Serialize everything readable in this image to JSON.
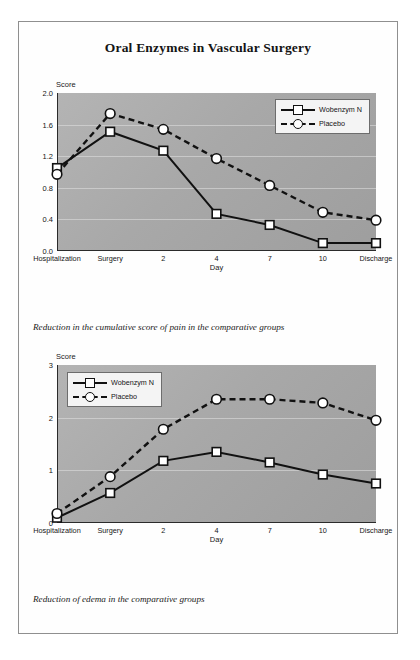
{
  "document": {
    "title": "Oral Enzymes in Vascular Surgery"
  },
  "figures": [
    {
      "id": "figure-1",
      "caption": "Reduction in the cumulative score of pain in the comparative groups",
      "legend_position": "top-right",
      "chart_data": {
        "type": "line",
        "title": "",
        "xlabel": "Day",
        "ylabel": "Score",
        "categories": [
          "Hospitalization",
          "Surgery",
          "2",
          "4",
          "7",
          "10",
          "Discharge"
        ],
        "yticks": [
          "0.0",
          "0.4",
          "0.8",
          "1.2",
          "1.6",
          "2.0"
        ],
        "ylim": [
          0.0,
          2.0
        ],
        "grid": true,
        "legend": [
          "Wobenzym N",
          "Placebo"
        ],
        "series": [
          {
            "name": "Wobenzym N",
            "marker": "square",
            "linestyle": "solid",
            "values": [
              1.05,
              1.51,
              1.27,
              0.47,
              0.33,
              0.1,
              0.1
            ]
          },
          {
            "name": "Placebo",
            "marker": "circle",
            "linestyle": "dashed",
            "values": [
              0.97,
              1.74,
              1.54,
              1.17,
              0.83,
              0.49,
              0.39
            ]
          }
        ]
      }
    },
    {
      "id": "figure-2",
      "caption": "Reduction of edema in the comparative groups",
      "legend_position": "top-left",
      "chart_data": {
        "type": "line",
        "title": "",
        "xlabel": "Day",
        "ylabel": "Score",
        "categories": [
          "Hospitalization",
          "Surgery",
          "2",
          "4",
          "7",
          "10",
          "Discharge"
        ],
        "yticks": [
          "0",
          "1",
          "2",
          "3"
        ],
        "ylim": [
          0,
          3
        ],
        "grid": true,
        "legend": [
          "Wobenzym N",
          "Placebo"
        ],
        "series": [
          {
            "name": "Wobenzym N",
            "marker": "square",
            "linestyle": "solid",
            "values": [
              0.1,
              0.57,
              1.18,
              1.35,
              1.15,
              0.92,
              0.75
            ]
          },
          {
            "name": "Placebo",
            "marker": "circle",
            "linestyle": "dashed",
            "values": [
              0.18,
              0.88,
              1.78,
              2.35,
              2.35,
              2.28,
              1.95
            ]
          }
        ]
      }
    }
  ],
  "colors": {
    "plot_background": "#a9a9a9",
    "line": "#111111",
    "marker_fill": "#ffffff",
    "page_border": "#8f8f8f"
  }
}
